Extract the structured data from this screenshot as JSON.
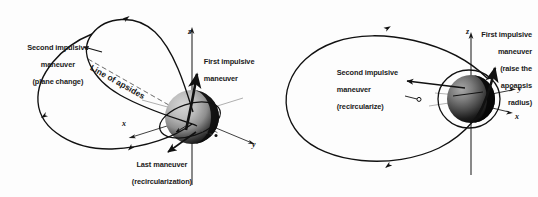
{
  "figure": {
    "type": "orbital-maneuver-diagram",
    "panel_count": 2,
    "background_color": "#fdfdfd",
    "line_color": "#111111"
  },
  "left_panel": {
    "name": "three-impulse-plane-change-transfer",
    "labels": {
      "second_maneuver": {
        "line1": "Second impulsive",
        "line2": "maneuver",
        "line3": "(plane change)"
      },
      "first_maneuver": {
        "line1": "First impulsive",
        "line2": "maneuver"
      },
      "last_maneuver": {
        "line1": "Last maneuver",
        "line2": "(recircularization)"
      },
      "line_of_apsides": "Line of apsides"
    },
    "axes": {
      "x": "x",
      "y": "y",
      "z": "z"
    },
    "body": {
      "name": "earth-sphere",
      "highlight_color": "#c9c9c9",
      "mid_color": "#8f8f8f",
      "shadow_color": "#121212"
    }
  },
  "right_panel": {
    "name": "two-impulse-hohmann-transfer",
    "labels": {
      "second_maneuver": {
        "line1": "Second impulsive",
        "line2": "maneuver",
        "line3": "(recircularize)"
      },
      "first_maneuver": {
        "line1": "First impulsive",
        "line2": "maneuver",
        "line3": "(raise the",
        "line4": "apoapsis",
        "line5": "radius)"
      }
    },
    "axes": {
      "x": "x",
      "y": "y",
      "z": "z"
    },
    "body": {
      "name": "earth-sphere",
      "highlight_color": "#9a9a9a",
      "mid_color": "#5a5a5a",
      "shadow_color": "#0c0c0c"
    }
  }
}
